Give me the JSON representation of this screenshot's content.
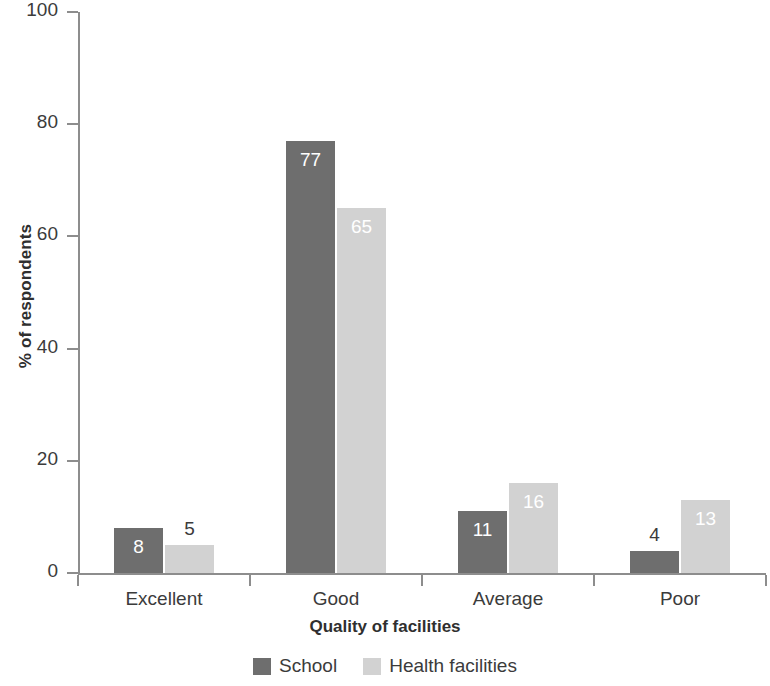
{
  "chart_data": {
    "type": "bar",
    "title": "",
    "xlabel": "Quality of facilities",
    "ylabel": "% of respondents",
    "categories": [
      "Excellent",
      "Good",
      "Average",
      "Poor"
    ],
    "series": [
      {
        "name": "School",
        "color": "#6e6e6e",
        "values": [
          8,
          77,
          11,
          4
        ]
      },
      {
        "name": "Health facilities",
        "color": "#d2d2d2",
        "values": [
          5,
          65,
          16,
          13
        ]
      }
    ],
    "ylim": [
      0,
      100
    ],
    "yticks": [
      0,
      20,
      40,
      60,
      80,
      100
    ],
    "ytick_labels": [
      "0",
      "20",
      "40",
      "60",
      "80",
      "100"
    ],
    "grid": false,
    "legend_position": "bottom",
    "data_labels": {
      "school": [
        "8",
        "77",
        "11",
        "4"
      ],
      "health": [
        "5",
        "65",
        "16",
        "13"
      ]
    }
  },
  "axes": {
    "y_title": "% of respondents",
    "x_title": "Quality of facilities"
  },
  "legend": {
    "entries": [
      {
        "label": "School"
      },
      {
        "label": "Health facilities"
      }
    ]
  }
}
